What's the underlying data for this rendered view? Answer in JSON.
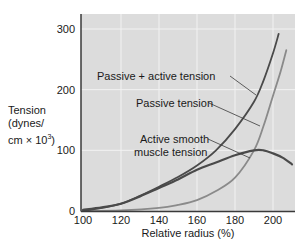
{
  "chart_data": {
    "type": "line",
    "title": "",
    "xlabel": "Relative radius (%)",
    "ylabel": "Tension (dynes/cm × 10³)",
    "ylabel_lines": [
      "Tension",
      "(dynes/",
      "cm × 10",
      "3",
      ")"
    ],
    "xlim": [
      100,
      212
    ],
    "ylim": [
      0,
      320
    ],
    "xticks": [
      100,
      120,
      140,
      160,
      180,
      200
    ],
    "yticks": [
      0,
      100,
      200,
      300
    ],
    "grid": true,
    "legend_position": "inline annotations with leader lines",
    "series": [
      {
        "name": "Passive + active tension",
        "color": "#4a4a4a",
        "x": [
          100,
          110,
          120,
          130,
          140,
          150,
          160,
          170,
          180,
          190,
          195,
          200,
          203
        ],
        "y": [
          0,
          5,
          12,
          25,
          40,
          56,
          75,
          100,
          135,
          180,
          215,
          260,
          292
        ]
      },
      {
        "name": "Passive tension",
        "color": "#8a8a8a",
        "x": [
          100,
          120,
          140,
          150,
          160,
          170,
          180,
          190,
          195,
          200,
          204,
          207
        ],
        "y": [
          0,
          1,
          5,
          10,
          18,
          33,
          55,
          100,
          140,
          190,
          230,
          265
        ]
      },
      {
        "name": "Active smooth muscle tension",
        "color": "#4a4a4a",
        "x": [
          100,
          110,
          120,
          130,
          140,
          150,
          160,
          170,
          180,
          190,
          195,
          200,
          205,
          210
        ],
        "y": [
          2,
          6,
          12,
          24,
          38,
          52,
          68,
          80,
          92,
          100,
          100,
          95,
          88,
          77
        ]
      }
    ],
    "annotations": [
      {
        "text": "Passive + active tension",
        "target_series": 0
      },
      {
        "text": "Passive tension",
        "target_series": 1
      },
      {
        "text": "Active smooth",
        "text2": "muscle tension",
        "target_series": 2
      }
    ]
  },
  "colors": {
    "plot_background": "#dcdcdc",
    "grid": "#f2f2f2",
    "axis": "#3a3a3a"
  }
}
